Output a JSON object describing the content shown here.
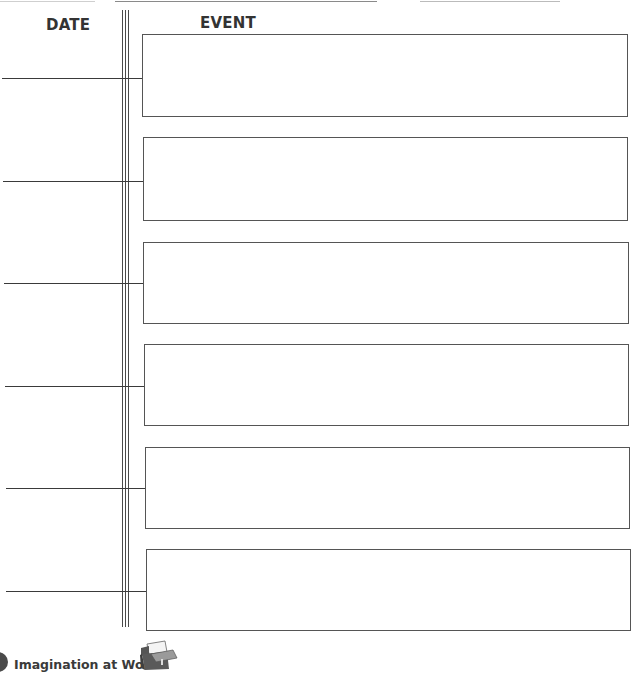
{
  "worksheet": {
    "columns": {
      "date_label": "DATE",
      "event_label": "EVENT"
    },
    "rows": [
      {
        "date": "",
        "event": ""
      },
      {
        "date": "",
        "event": ""
      },
      {
        "date": "",
        "event": ""
      },
      {
        "date": "",
        "event": ""
      },
      {
        "date": "",
        "event": ""
      },
      {
        "date": "",
        "event": ""
      }
    ]
  },
  "footer": {
    "label": "Imagination at Work",
    "icon": "file-box-icon"
  }
}
